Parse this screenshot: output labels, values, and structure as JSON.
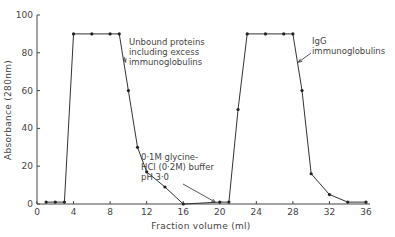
{
  "chart_data": {
    "type": "line",
    "title": "",
    "xlabel": "Fraction volume (ml)",
    "ylabel": "Absorbance (280nm)",
    "xlim": [
      0,
      36
    ],
    "ylim": [
      0,
      100
    ],
    "xticks": [
      0,
      4,
      8,
      12,
      16,
      20,
      24,
      28,
      32,
      36
    ],
    "yticks": [
      0,
      20,
      40,
      60,
      80,
      100
    ],
    "grid": false,
    "legend": null,
    "series": [
      {
        "name": "Absorbance",
        "x": [
          1,
          2,
          3,
          4,
          6,
          8,
          9,
          10,
          11,
          12,
          14,
          16,
          20,
          21,
          22,
          23,
          25,
          27,
          28,
          29,
          30,
          32,
          34,
          36
        ],
        "y": [
          1,
          1,
          1,
          90,
          90,
          90,
          90,
          60,
          30,
          17,
          9,
          0,
          1,
          1,
          50,
          90,
          90,
          90,
          90,
          60,
          16,
          5,
          1,
          1
        ]
      }
    ],
    "annotations": [
      {
        "lines": [
          "Unbound proteins",
          "including excess",
          "immunoglobulins"
        ],
        "arrow_to": [
          9.7,
          75
        ]
      },
      {
        "lines": [
          "0·1M glycine-",
          "HCl (0·2M) buffer",
          "pH 3·0"
        ],
        "arrow_to": [
          19.5,
          1
        ]
      },
      {
        "lines": [
          "IgG",
          "immunoglobulins"
        ],
        "arrow_to": [
          28.6,
          75
        ]
      }
    ]
  }
}
